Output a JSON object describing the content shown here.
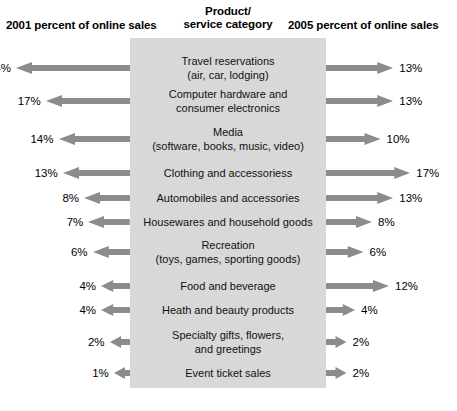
{
  "headers": {
    "left": "2001 percent of online sales",
    "middle": "Product/ service category",
    "middle_line1": "Product/",
    "middle_line2": "service category",
    "right": "2005 percent of online sales"
  },
  "colors": {
    "panel_background": "#d8d8d8",
    "arrow": "#8c8c8c",
    "text": "#000000",
    "page_background": "#ffffff"
  },
  "chart_data": {
    "type": "bar",
    "title": "Product/ service category",
    "xlabel": "",
    "ylabel": "",
    "categories": [
      "Travel reservations (air, car, lodging)",
      "Computer hardware and consumer electronics",
      "Media (software, books, music, video)",
      "Clothing and accessoriess",
      "Automobiles and accessories",
      "Housewares and household goods",
      "Recreation (toys, games, sporting goods)",
      "Food and beverage",
      "Heath and beauty products",
      "Specialty gifts, flowers, and greetings",
      "Event ticket sales"
    ],
    "series": [
      {
        "name": "2001 percent of online sales",
        "values": [
          24,
          17,
          14,
          13,
          8,
          7,
          6,
          4,
          4,
          2,
          1
        ]
      },
      {
        "name": "2005 percent of online sales",
        "values": [
          13,
          13,
          10,
          17,
          13,
          8,
          6,
          12,
          4,
          2,
          2
        ]
      }
    ],
    "unit": "%",
    "grid": false,
    "legend_position": "top"
  },
  "rows": [
    {
      "label_lines": [
        "Travel reservations",
        "(air, car, lodging)"
      ],
      "left_value": "24%",
      "right_value": "13%",
      "left_pct": 24,
      "right_pct": 13,
      "y": 68
    },
    {
      "label_lines": [
        "Computer hardware and",
        "consumer electronics"
      ],
      "left_value": "17%",
      "right_value": "13%",
      "left_pct": 17,
      "right_pct": 13,
      "y": 101
    },
    {
      "label_lines": [
        "Media",
        "(software, books, music, video)"
      ],
      "left_value": "14%",
      "right_value": "10%",
      "left_pct": 14,
      "right_pct": 10,
      "y": 139
    },
    {
      "label_lines": [
        "Clothing and accessoriess"
      ],
      "left_value": "13%",
      "right_value": "17%",
      "left_pct": 13,
      "right_pct": 17,
      "y": 173
    },
    {
      "label_lines": [
        "Automobiles and accessories"
      ],
      "left_value": "8%",
      "right_value": "13%",
      "left_pct": 8,
      "right_pct": 13,
      "y": 198
    },
    {
      "label_lines": [
        "Housewares and household goods"
      ],
      "left_value": "7%",
      "right_value": "8%",
      "left_pct": 7,
      "right_pct": 8,
      "y": 222
    },
    {
      "label_lines": [
        "Recreation",
        "(toys, games, sporting goods)"
      ],
      "left_value": "6%",
      "right_value": "6%",
      "left_pct": 6,
      "right_pct": 6,
      "y": 252
    },
    {
      "label_lines": [
        "Food and beverage"
      ],
      "left_value": "4%",
      "right_value": "12%",
      "left_pct": 4,
      "right_pct": 12,
      "y": 286
    },
    {
      "label_lines": [
        "Heath and beauty products"
      ],
      "left_value": "4%",
      "right_value": "4%",
      "left_pct": 4,
      "right_pct": 4,
      "y": 310
    },
    {
      "label_lines": [
        "Specialty gifts, flowers,",
        "and greetings"
      ],
      "left_value": "2%",
      "right_value": "2%",
      "left_pct": 2,
      "right_pct": 2,
      "y": 342
    },
    {
      "label_lines": [
        "Event ticket sales"
      ],
      "left_value": "1%",
      "right_value": "2%",
      "left_pct": 1,
      "right_pct": 2,
      "y": 373
    }
  ]
}
